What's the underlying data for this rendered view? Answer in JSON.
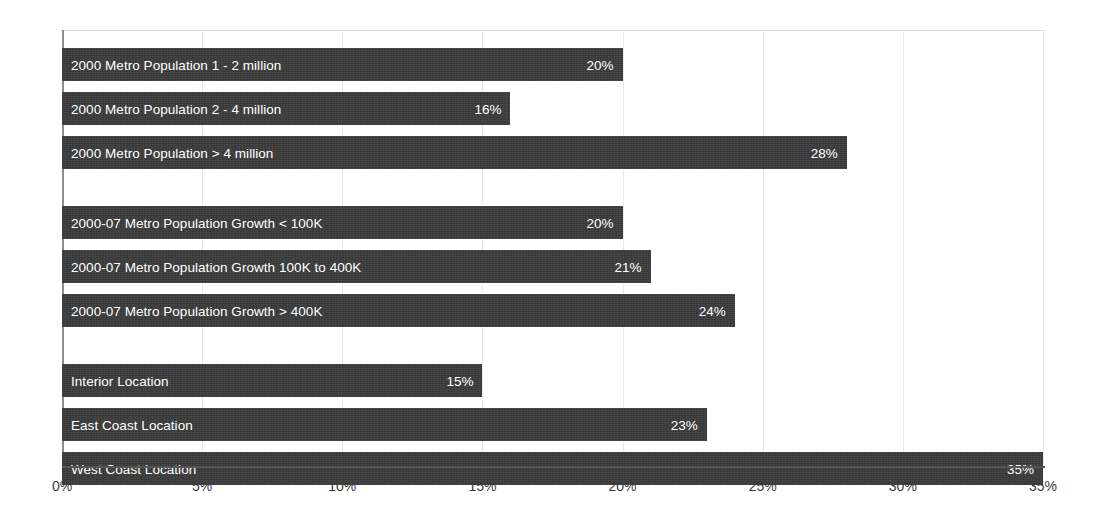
{
  "chart_data": {
    "type": "bar",
    "orientation": "horizontal",
    "title": "",
    "xlabel": "",
    "ylabel": "",
    "xlim": [
      0,
      35
    ],
    "grid": true,
    "legend": null,
    "xtick_labels": [
      "0%",
      "5%",
      "10%",
      "15%",
      "20%",
      "25%",
      "30%",
      "35%"
    ],
    "xticks": [
      0,
      5,
      10,
      15,
      20,
      25,
      30,
      35
    ],
    "value_suffix": "%",
    "bar_color": "#3b3b3b",
    "label_color": "#ffffff",
    "background_color": "#ffffff",
    "gridline_color": "#e9e9e9",
    "axis_color": "#555555",
    "groups": [
      {
        "name": "2000 Metro Population",
        "bars": [
          {
            "label": "2000 Metro Population 1 - 2 million",
            "value": 20,
            "value_label": "20%"
          },
          {
            "label": "2000 Metro Population 2 - 4 million",
            "value": 16,
            "value_label": "16%"
          },
          {
            "label": "2000 Metro Population > 4 million",
            "value": 28,
            "value_label": "28%"
          }
        ]
      },
      {
        "name": "2000-07 Metro Population Growth",
        "bars": [
          {
            "label": "2000-07 Metro Population Growth < 100K",
            "value": 20,
            "value_label": "20%"
          },
          {
            "label": "2000-07 Metro Population Growth 100K to 400K",
            "value": 21,
            "value_label": "21%"
          },
          {
            "label": "2000-07 Metro Population Growth > 400K",
            "value": 24,
            "value_label": "24%"
          }
        ]
      },
      {
        "name": "Location",
        "bars": [
          {
            "label": "Interior Location",
            "value": 15,
            "value_label": "15%"
          },
          {
            "label": "East Coast Location",
            "value": 23,
            "value_label": "23%"
          },
          {
            "label": "West Coast Location",
            "value": 35,
            "value_label": "35%"
          }
        ]
      }
    ],
    "categories": [
      "2000 Metro Population 1 - 2 million",
      "2000 Metro Population 2 - 4 million",
      "2000 Metro Population > 4 million",
      "2000-07 Metro Population Growth < 100K",
      "2000-07 Metro Population Growth 100K to 400K",
      "2000-07 Metro Population Growth > 400K",
      "Interior Location",
      "East Coast Location",
      "West Coast Location"
    ],
    "values": [
      20,
      16,
      28,
      20,
      21,
      24,
      15,
      23,
      35
    ]
  }
}
